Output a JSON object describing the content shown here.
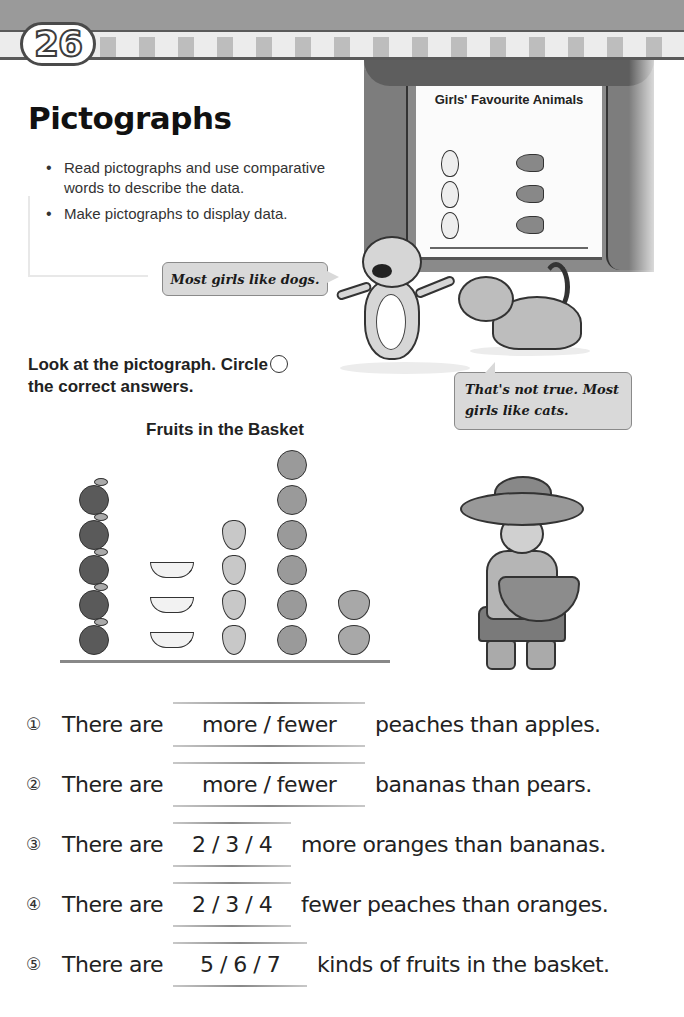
{
  "header": {
    "unit_number": "26"
  },
  "title": "Pictographs",
  "objectives": [
    "Read pictographs and use comparative words to describe the data.",
    "Make pictographs to display data."
  ],
  "illustration": {
    "screen_title": "Girls' Favourite Animals",
    "dog_speech": "Most girls like dogs.",
    "cat_speech": "That's not true.  Most girls like cats."
  },
  "instruction": {
    "line1": "Look at the pictograph.  Circle",
    "line2": "the correct answers."
  },
  "chart_data": [
    {
      "type": "pictograph",
      "title": "Fruits in the Basket",
      "categories": [
        "Apple",
        "Banana",
        "Pear",
        "Orange",
        "Peach"
      ],
      "values": [
        5,
        3,
        4,
        6,
        2
      ],
      "xlabel": "",
      "ylabel": "",
      "grid": false
    },
    {
      "type": "pictograph",
      "title": "Girls' Favourite Animals",
      "categories": [
        "Rabbit",
        "Dog",
        "Fish",
        "Cat"
      ],
      "values": [
        3,
        2,
        3,
        4
      ],
      "xlabel": "",
      "ylabel": "",
      "grid": false
    }
  ],
  "questions": [
    {
      "num": "①",
      "pre": "There are",
      "choices": "more  /  fewer",
      "post": "peaches than apples."
    },
    {
      "num": "②",
      "pre": "There are",
      "choices": "more  /  fewer",
      "post": "bananas than pears."
    },
    {
      "num": "③",
      "pre": "There are",
      "choices": "2 / 3 / 4",
      "post": "more oranges than bananas."
    },
    {
      "num": "④",
      "pre": "There are",
      "choices": "2 / 3 / 4",
      "post": "fewer peaches than oranges."
    },
    {
      "num": "⑤",
      "pre": "There are",
      "choices": "5  /  6  /  7",
      "post": "kinds of fruits in the basket."
    }
  ]
}
